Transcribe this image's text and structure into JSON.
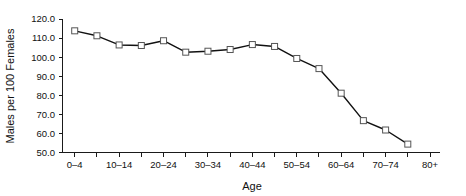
{
  "chart_data": {
    "type": "line",
    "title": "",
    "xlabel": "Age",
    "ylabel": "Males per 100 Females",
    "grid": false,
    "legend": "none",
    "ylim": [
      50.0,
      120.0
    ],
    "ytick_step": 10.0,
    "yticks": [
      "120.0",
      "110.0",
      "100.0",
      "90.0",
      "80.0",
      "70.0",
      "60.0",
      "50.0"
    ],
    "ytick_values": [
      120.0,
      110.0,
      100.0,
      90.0,
      80.0,
      70.0,
      60.0,
      50.0
    ],
    "categories": [
      "0–4",
      "5–9",
      "10–14",
      "15–19",
      "20–24",
      "25–29",
      "30–34",
      "35–39",
      "40–44",
      "45–49",
      "50–54",
      "55–59",
      "60–64",
      "65–69",
      "70–74",
      "75–79",
      "80+"
    ],
    "xtick_labels_shown": [
      "0–4",
      "10–14",
      "20–24",
      "30–34",
      "40–44",
      "50–54",
      "60–64",
      "70–74",
      "80+"
    ],
    "values": [
      113.8,
      111.2,
      106.4,
      106.1,
      108.6,
      102.6,
      103.1,
      104.0,
      106.6,
      105.6,
      99.3,
      94.0,
      81.1,
      66.7,
      61.8,
      54.4,
      null
    ],
    "series": [
      {
        "name": "Males per 100 Females",
        "marker": "square-open",
        "line_color": "#111111",
        "marker_fill": "#ffffff",
        "marker_edge": "#555555",
        "points": [
          {
            "x": "0–4",
            "y": 113.8
          },
          {
            "x": "5–9",
            "y": 111.2
          },
          {
            "x": "10–14",
            "y": 106.4
          },
          {
            "x": "15–19",
            "y": 106.1
          },
          {
            "x": "20–24",
            "y": 108.6
          },
          {
            "x": "25–29",
            "y": 102.6
          },
          {
            "x": "30–34",
            "y": 103.1
          },
          {
            "x": "35–39",
            "y": 104.0
          },
          {
            "x": "40–44",
            "y": 106.6
          },
          {
            "x": "45–49",
            "y": 105.6
          },
          {
            "x": "50–54",
            "y": 99.3
          },
          {
            "x": "55–59",
            "y": 94.0
          },
          {
            "x": "60–64",
            "y": 81.1
          },
          {
            "x": "65–69",
            "y": 66.7
          },
          {
            "x": "70–74",
            "y": 61.8
          },
          {
            "x": "75–79",
            "y": 54.4
          }
        ]
      }
    ]
  },
  "axes": {
    "y_title": "Males per 100 Females",
    "x_title": "Age"
  }
}
